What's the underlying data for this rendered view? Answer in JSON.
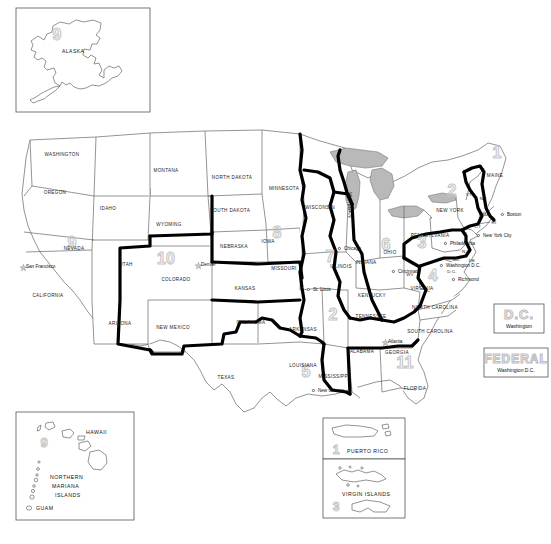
{
  "map": {
    "title": "United States Federal Judicial Circuits",
    "background_color": "#ffffff",
    "state_outline_color": "#555555",
    "circuit_boundary_color": "#000000",
    "lake_fill_color": "#b9b9b9",
    "circuit_number_color": "#c9c9c9",
    "label_color": "#1a1a1a"
  },
  "inset_alaska": {
    "state_label": "ALASKA",
    "circuit_number": "9"
  },
  "inset_pacific": {
    "hawaii_label": "HAWAII",
    "hawaii_circuit_number": "9",
    "northern_mariana_label_line1": "NORTHERN",
    "northern_mariana_label_line2": "MARIANA",
    "northern_mariana_label_line3": "ISLANDS",
    "guam_label": "GUAM"
  },
  "inset_puerto_rico": {
    "label": "PUERTO RICO",
    "circuit_number": "1"
  },
  "inset_virgin_islands": {
    "label": "VIRGIN ISLANDS",
    "circuit_number": "3"
  },
  "legend_dc": {
    "title": "D.C.",
    "subtitle": "Washington"
  },
  "legend_federal": {
    "title": "FEDERAL",
    "subtitle": "Washington D.C."
  },
  "circuits": [
    {
      "number": "1",
      "x": 497,
      "y": 158
    },
    {
      "number": "2",
      "x": 452,
      "y": 196
    },
    {
      "number": "3",
      "x": 422,
      "y": 248
    },
    {
      "number": "4",
      "x": 433,
      "y": 281
    },
    {
      "number": "5",
      "x": 306,
      "y": 377
    },
    {
      "number": "6",
      "x": 386,
      "y": 250
    },
    {
      "number": "7",
      "x": 330,
      "y": 262
    },
    {
      "number": "8",
      "x": 277,
      "y": 238
    },
    {
      "number": "9",
      "x": 72,
      "y": 248
    },
    {
      "number": "10",
      "x": 166,
      "y": 264
    },
    {
      "number": "11",
      "x": 405,
      "y": 368
    },
    {
      "number": "2",
      "x": 333,
      "y": 320
    }
  ],
  "states": [
    {
      "name": "WASHINGTON",
      "x": 62,
      "y": 156
    },
    {
      "name": "OREGON",
      "x": 55,
      "y": 194
    },
    {
      "name": "IDAHO",
      "x": 108,
      "y": 210
    },
    {
      "name": "MONTANA",
      "x": 166,
      "y": 172
    },
    {
      "name": "NORTH DAKOTA",
      "x": 232,
      "y": 179
    },
    {
      "name": "SOUTH DAKOTA",
      "x": 230,
      "y": 212
    },
    {
      "name": "MINNESOTA",
      "x": 284,
      "y": 190
    },
    {
      "name": "WYOMING",
      "x": 169,
      "y": 226
    },
    {
      "name": "NEBRASKA",
      "x": 234,
      "y": 248
    },
    {
      "name": "IOWA",
      "x": 268,
      "y": 243
    },
    {
      "name": "WISCONSIN",
      "x": 320,
      "y": 209
    },
    {
      "name": "NEVADA",
      "x": 74,
      "y": 250
    },
    {
      "name": "UTAH",
      "x": 126,
      "y": 266
    },
    {
      "name": "COLORADO",
      "x": 176,
      "y": 281
    },
    {
      "name": "KANSAS",
      "x": 245,
      "y": 290
    },
    {
      "name": "MISSOURI",
      "x": 284,
      "y": 270
    },
    {
      "name": "ILLINOIS",
      "x": 341,
      "y": 268
    },
    {
      "name": "INDIANA",
      "x": 366,
      "y": 264
    },
    {
      "name": "OHIO",
      "x": 390,
      "y": 254
    },
    {
      "name": "CALIFORNIA",
      "x": 48,
      "y": 297
    },
    {
      "name": "ARIZONA",
      "x": 120,
      "y": 325
    },
    {
      "name": "NEW MEXICO",
      "x": 173,
      "y": 329
    },
    {
      "name": "OKLAHOMA",
      "x": 251,
      "y": 324
    },
    {
      "name": "ARKANSAS",
      "x": 303,
      "y": 331
    },
    {
      "name": "KENTUCKY",
      "x": 372,
      "y": 297
    },
    {
      "name": "TENNESSEE",
      "x": 371,
      "y": 318
    },
    {
      "name": "TEXAS",
      "x": 226,
      "y": 379
    },
    {
      "name": "LOUISIANA",
      "x": 303,
      "y": 367
    },
    {
      "name": "MISSISSIPPI",
      "x": 334,
      "y": 378
    },
    {
      "name": "ALABAMA",
      "x": 362,
      "y": 353
    },
    {
      "name": "GEORGIA",
      "x": 397,
      "y": 354
    },
    {
      "name": "FLORIDA",
      "x": 415,
      "y": 390
    },
    {
      "name": "NORTH CAROLINA",
      "x": 435,
      "y": 309
    },
    {
      "name": "SOUTH CAROLINA",
      "x": 430,
      "y": 333
    },
    {
      "name": "VIRGINIA",
      "x": 422,
      "y": 290
    },
    {
      "name": "PENNSYLVANIA",
      "x": 430,
      "y": 237
    },
    {
      "name": "NEW YORK",
      "x": 450,
      "y": 212
    },
    {
      "name": "MAINE",
      "x": 495,
      "y": 177
    },
    {
      "name": "MICHIGAN",
      "x": 348,
      "y": 205
    }
  ],
  "state_abbrevs": [
    {
      "name": "VT",
      "x": 469,
      "y": 196
    },
    {
      "name": "NH",
      "x": 483,
      "y": 200
    },
    {
      "name": "MA",
      "x": 486,
      "y": 216
    },
    {
      "name": "CT",
      "x": 478,
      "y": 228
    },
    {
      "name": "RI",
      "x": 494,
      "y": 224
    },
    {
      "name": "NJ",
      "x": 465,
      "y": 253
    },
    {
      "name": "DE",
      "x": 472,
      "y": 262
    },
    {
      "name": "MD",
      "x": 456,
      "y": 261
    },
    {
      "name": "WV",
      "x": 410,
      "y": 276
    },
    {
      "name": "D.C.",
      "x": 452,
      "y": 273
    }
  ],
  "cities": [
    {
      "name": "San Francisco",
      "x": 23,
      "y": 268,
      "marker": "star"
    },
    {
      "name": "Denver",
      "x": 198,
      "y": 266,
      "marker": "star"
    },
    {
      "name": "St. Louis",
      "x": 310,
      "y": 291,
      "marker": "dot"
    },
    {
      "name": "Chicago",
      "x": 341,
      "y": 250,
      "marker": "dot"
    },
    {
      "name": "Cincinnati",
      "x": 395,
      "y": 273,
      "marker": "dot"
    },
    {
      "name": "Washington D.C.",
      "x": 443,
      "y": 267,
      "marker": "dot"
    },
    {
      "name": "Richmond",
      "x": 455,
      "y": 281,
      "marker": "dot"
    },
    {
      "name": "Philadelphia",
      "x": 447,
      "y": 245,
      "marker": "dot"
    },
    {
      "name": "New York City",
      "x": 480,
      "y": 237,
      "marker": "dot"
    },
    {
      "name": "Boston",
      "x": 504,
      "y": 216,
      "marker": "dot"
    },
    {
      "name": "Atlanta",
      "x": 385,
      "y": 343,
      "marker": "star"
    },
    {
      "name": "New Orleans",
      "x": 315,
      "y": 392,
      "marker": "dot"
    }
  ]
}
